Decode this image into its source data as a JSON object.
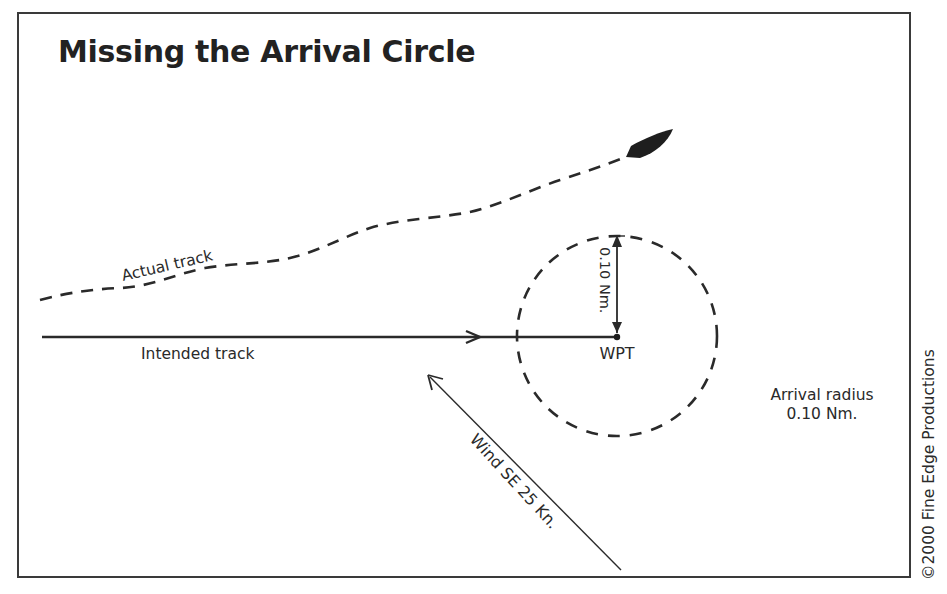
{
  "title": "Missing the Arrival Circle",
  "labels": {
    "actual_track": "Actual track",
    "intended_track": "Intended track",
    "waypoint": "WPT",
    "radius_measure": "0.10 Nm.",
    "wind": "Wind SE 25 Kn.",
    "arrival_radius_line1": "Arrival radius",
    "arrival_radius_line2": "0.10 Nm."
  },
  "copyright": "©2000 Fine Edge Productions",
  "colors": {
    "ink": "#2a2a2a",
    "frame": "#3a3a3a",
    "background": "#ffffff"
  },
  "diagram": {
    "arrival_circle": {
      "radius_nm": "0.10",
      "style": "dashed"
    },
    "intended_track": {
      "style": "solid",
      "direction": "east"
    },
    "actual_track": {
      "style": "dashed"
    },
    "wind": {
      "direction": "SE",
      "speed_kn": "25"
    },
    "vessel": "boat-icon"
  }
}
